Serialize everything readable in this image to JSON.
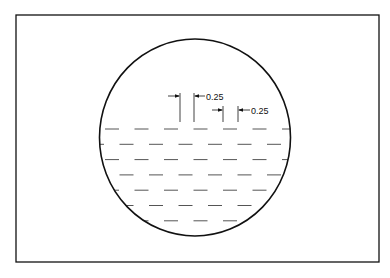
{
  "diagram": {
    "dimensions": [
      {
        "label": "0.25"
      },
      {
        "label": "0.25"
      }
    ],
    "dash_rows": 7,
    "colors": {
      "stroke": "#111111",
      "dash": "#555555",
      "background": "#ffffff"
    }
  }
}
